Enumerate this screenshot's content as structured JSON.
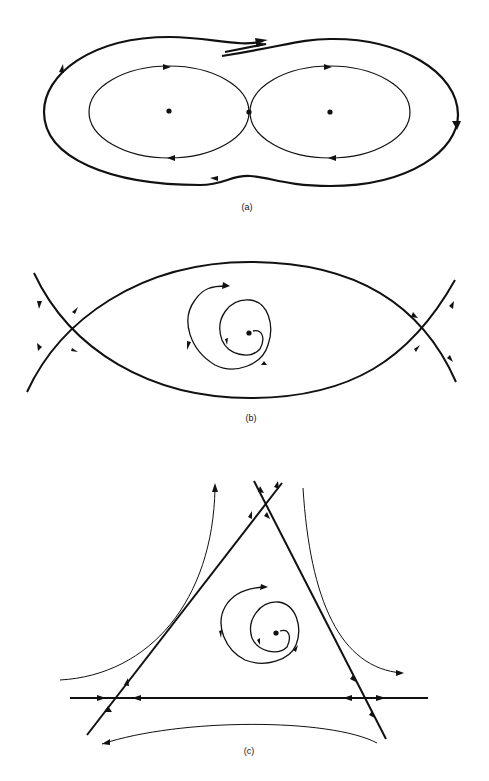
{
  "figure": {
    "panels": [
      {
        "id": "a",
        "label": "(a)",
        "description": "Two centers enclosed by homoclinic figure-eight separatrix with outer periodic orbit"
      },
      {
        "id": "b",
        "label": "(b)",
        "description": "Spiral focus inside heteroclinic lens between two saddles"
      },
      {
        "id": "c",
        "label": "(c)",
        "description": "Spiral focus inside triangle of three saddles connected by straight separatrices"
      }
    ],
    "colors": {
      "ink": "#111111",
      "background": "#ffffff"
    }
  }
}
